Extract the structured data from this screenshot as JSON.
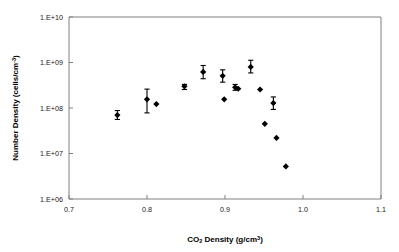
{
  "chart_data": {
    "type": "scatter",
    "title": "",
    "xlabel": "CO2 Density (g/cm^3)",
    "ylabel": "Number Density (cells/cm^3)",
    "xlabel_parts": {
      "pre": "CO",
      "sub": "2",
      "mid": " Density (g/cm",
      "sup": "3",
      "post": ")"
    },
    "ylabel_parts": {
      "pre": "Number Density (cells/cm",
      "sup": "-3",
      "post": ")"
    },
    "xlim": [
      0.7,
      1.1
    ],
    "ylim": [
      1000000,
      10000000000
    ],
    "yscale": "log",
    "xscale": "linear",
    "grid": false,
    "legend": null,
    "xticks": [
      0.7,
      0.8,
      0.9,
      1.0,
      1.1
    ],
    "xticklabels": [
      "0.7",
      "0.8",
      "0.9",
      "1.0",
      "1.1"
    ],
    "yticks": [
      1000000,
      10000000,
      100000000,
      1000000000,
      10000000000
    ],
    "yticklabels": [
      "1.E+06",
      "1.E+07",
      "1.E+08",
      "1.E+09",
      "1.E+10"
    ],
    "marker": "filled-diamond",
    "marker_color": "#000000",
    "errorbars": "vertical",
    "points": [
      {
        "x": 0.762,
        "y": 70000000.0,
        "yerr_low": 56000000.0,
        "yerr_high": 88000000.0
      },
      {
        "x": 0.8,
        "y": 155000000.0,
        "yerr_low": 78000000.0,
        "yerr_high": 260000000.0
      },
      {
        "x": 0.812,
        "y": 122000000.0,
        "yerr_low": null,
        "yerr_high": null
      },
      {
        "x": 0.848,
        "y": 300000000.0,
        "yerr_low": 255000000.0,
        "yerr_high": 330000000.0
      },
      {
        "x": 0.872,
        "y": 620000000.0,
        "yerr_low": 440000000.0,
        "yerr_high": 860000000.0
      },
      {
        "x": 0.897,
        "y": 510000000.0,
        "yerr_low": 370000000.0,
        "yerr_high": 690000000.0
      },
      {
        "x": 0.899,
        "y": 155000000.0,
        "yerr_low": null,
        "yerr_high": null
      },
      {
        "x": 0.913,
        "y": 285000000.0,
        "yerr_low": 245000000.0,
        "yerr_high": 330000000.0
      },
      {
        "x": 0.917,
        "y": 265000000.0,
        "yerr_low": null,
        "yerr_high": null
      },
      {
        "x": 0.933,
        "y": 800000000.0,
        "yerr_low": 590000000.0,
        "yerr_high": 1120000000.0
      },
      {
        "x": 0.945,
        "y": 255000000.0,
        "yerr_low": null,
        "yerr_high": null
      },
      {
        "x": 0.951,
        "y": 45000000.0,
        "yerr_low": null,
        "yerr_high": null
      },
      {
        "x": 0.962,
        "y": 128000000.0,
        "yerr_low": 93000000.0,
        "yerr_high": 175000000.0
      },
      {
        "x": 0.966,
        "y": 22000000.0,
        "yerr_low": null,
        "yerr_high": null
      },
      {
        "x": 0.978,
        "y": 5200000.0,
        "yerr_low": null,
        "yerr_high": null
      }
    ]
  }
}
